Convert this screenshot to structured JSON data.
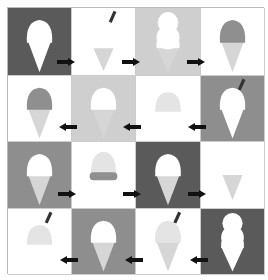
{
  "colors": {
    "dark": "#5a5a5a",
    "medium": "#8e8e8e",
    "light": "#cfcfcf",
    "white": "#ffffff",
    "scoop_white": "#ffffff",
    "scoop_gray": "#8f8f8f",
    "scoop_pale": "#e4e4e4",
    "cone_pale": "#d6d6d6",
    "cone_white": "#ffffff",
    "stick": "#333333",
    "arrow": "#111111"
  },
  "rows": [
    {
      "direction": "right",
      "cells": [
        {
          "bg": "dark",
          "scoop": "scoop_white",
          "cone": "cone_white",
          "shape": "single",
          "stick": false
        },
        {
          "bg": "white",
          "scoop": "none",
          "cone": "cone_pale",
          "shape": "cone-only",
          "stick": true
        },
        {
          "bg": "light",
          "scoop": "scoop_white",
          "cone": "cone_pale",
          "shape": "double",
          "stick": false
        },
        {
          "bg": "white",
          "scoop": "scoop_gray",
          "cone": "cone_pale",
          "shape": "single",
          "stick": false
        }
      ]
    },
    {
      "direction": "left",
      "cells": [
        {
          "bg": "white",
          "scoop": "scoop_gray",
          "cone": "cone_pale",
          "shape": "single",
          "stick": false
        },
        {
          "bg": "light",
          "scoop": "scoop_white",
          "cone": "cone_pale",
          "shape": "single",
          "stick": false
        },
        {
          "bg": "white",
          "scoop": "scoop_pale",
          "cone": "none",
          "shape": "scoop-only",
          "stick": false
        },
        {
          "bg": "medium",
          "scoop": "scoop_white",
          "cone": "cone_white",
          "shape": "single",
          "stick": true
        }
      ]
    },
    {
      "direction": "right",
      "cells": [
        {
          "bg": "medium",
          "scoop": "scoop_white",
          "cone": "cone_pale",
          "shape": "single",
          "stick": false
        },
        {
          "bg": "white",
          "scoop": "scoop_pale",
          "cone": "none",
          "shape": "scoop-base",
          "stick": false
        },
        {
          "bg": "dark",
          "scoop": "scoop_white",
          "cone": "cone_pale",
          "shape": "single",
          "stick": false
        },
        {
          "bg": "white",
          "scoop": "scoop_pale",
          "cone": "cone_pale",
          "shape": "faint",
          "stick": false
        }
      ]
    },
    {
      "direction": "left",
      "cells": [
        {
          "bg": "white",
          "scoop": "scoop_pale",
          "cone": "none",
          "shape": "scoop-only",
          "stick": true
        },
        {
          "bg": "medium",
          "scoop": "scoop_white",
          "cone": "cone_pale",
          "shape": "single",
          "stick": false
        },
        {
          "bg": "white",
          "scoop": "scoop_pale",
          "cone": "cone_pale",
          "shape": "single",
          "stick": true
        },
        {
          "bg": "dark",
          "scoop": "scoop_white",
          "cone": "cone_white",
          "shape": "double",
          "stick": false
        }
      ]
    }
  ],
  "arrows": [
    {
      "row": 0,
      "x": 57,
      "y": 62,
      "dir": "right"
    },
    {
      "row": 0,
      "x": 122,
      "y": 62,
      "dir": "right"
    },
    {
      "row": 0,
      "x": 187,
      "y": 62,
      "dir": "right"
    },
    {
      "row": 1,
      "x": 59,
      "y": 127,
      "dir": "left"
    },
    {
      "row": 1,
      "x": 123,
      "y": 127,
      "dir": "left"
    },
    {
      "row": 1,
      "x": 188,
      "y": 127,
      "dir": "left"
    },
    {
      "row": 2,
      "x": 58,
      "y": 194,
      "dir": "right"
    },
    {
      "row": 2,
      "x": 123,
      "y": 194,
      "dir": "right"
    },
    {
      "row": 2,
      "x": 188,
      "y": 194,
      "dir": "right"
    },
    {
      "row": 3,
      "x": 60,
      "y": 260,
      "dir": "left"
    },
    {
      "row": 3,
      "x": 125,
      "y": 260,
      "dir": "left"
    },
    {
      "row": 3,
      "x": 190,
      "y": 260,
      "dir": "left"
    }
  ]
}
